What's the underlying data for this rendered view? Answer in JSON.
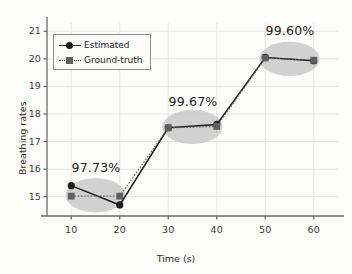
{
  "chart_data": {
    "type": "line",
    "title": "",
    "xlabel": "Time (s)",
    "ylabel": "Breathing rates",
    "x": [
      10,
      20,
      30,
      40,
      50,
      60
    ],
    "xticks": [
      "10",
      "20",
      "30",
      "40",
      "50",
      "60"
    ],
    "yticks": [
      "15",
      "16",
      "17",
      "18",
      "19",
      "20",
      "21"
    ],
    "xlim": [
      5,
      65
    ],
    "ylim": [
      14.3,
      21.3
    ],
    "grid": true,
    "legend_position": "upper-left",
    "series": [
      {
        "name": "Estimated",
        "marker": "circle",
        "linestyle": "solid",
        "color": "#1e1e1e",
        "values": [
          15.4,
          14.7,
          17.5,
          17.62,
          20.05,
          19.93
        ]
      },
      {
        "name": "Ground-truth",
        "marker": "square",
        "linestyle": "dotted",
        "color": "#5f5f5f",
        "values": [
          15.02,
          15.02,
          17.5,
          17.55,
          20.03,
          19.95
        ]
      }
    ],
    "annotations": [
      {
        "label": "97.73%",
        "x": 15,
        "y": 16.05,
        "group_x": [
          10,
          20
        ]
      },
      {
        "label": "99.67%",
        "x": 35,
        "y": 18.45,
        "group_x": [
          30,
          40
        ]
      },
      {
        "label": "99.60%",
        "x": 55,
        "y": 21.0,
        "group_x": [
          50,
          60
        ]
      }
    ],
    "highlight_ellipses": [
      {
        "cx": 15,
        "cy": 15.05,
        "rx": 6.2,
        "ry": 0.62
      },
      {
        "cx": 35,
        "cy": 17.53,
        "rx": 6.2,
        "ry": 0.62
      },
      {
        "cx": 55,
        "cy": 20.0,
        "rx": 6.2,
        "ry": 0.62
      }
    ],
    "colors": {
      "ellipse_fill": "#c9c9c9",
      "axis": "#6b6b6b",
      "grid": "#e8e6e2",
      "background": "#fdfdfb",
      "estimated": "#1e1e1e",
      "ground_truth": "#5f5f5f"
    }
  }
}
